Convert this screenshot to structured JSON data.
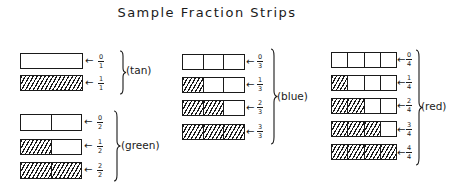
{
  "title": "Sample Fraction Strips",
  "groups": [
    {
      "color_label": "(tan)",
      "denominator": 1,
      "strips": [
        {
          "fraction": {
            "num": "0",
            "den": "1"
          },
          "shaded": 0,
          "parts": 1
        },
        {
          "fraction": {
            "num": "1",
            "den": "1"
          },
          "shaded": 1,
          "parts": 1
        }
      ]
    },
    {
      "color_label": "(green)",
      "denominator": 2,
      "strips": [
        {
          "fraction": {
            "num": "0",
            "den": "2"
          },
          "shaded": 0,
          "parts": 2
        },
        {
          "fraction": {
            "num": "1",
            "den": "2"
          },
          "shaded": 1,
          "parts": 2
        },
        {
          "fraction": {
            "num": "2",
            "den": "2"
          },
          "shaded": 2,
          "parts": 2
        }
      ]
    },
    {
      "color_label": "(blue)",
      "denominator": 3,
      "strips": [
        {
          "fraction": {
            "num": "0",
            "den": "3"
          },
          "shaded": 0,
          "parts": 3
        },
        {
          "fraction": {
            "num": "1",
            "den": "3"
          },
          "shaded": 1,
          "parts": 3
        },
        {
          "fraction": {
            "num": "2",
            "den": "3"
          },
          "shaded": 2,
          "parts": 3
        },
        {
          "fraction": {
            "num": "3",
            "den": "3"
          },
          "shaded": 3,
          "parts": 3
        }
      ]
    },
    {
      "color_label": "(red)",
      "denominator": 4,
      "strips": [
        {
          "fraction": {
            "num": "0",
            "den": "4"
          },
          "shaded": 0,
          "parts": 4
        },
        {
          "fraction": {
            "num": "1",
            "den": "4"
          },
          "shaded": 1,
          "parts": 4
        },
        {
          "fraction": {
            "num": "2",
            "den": "4"
          },
          "shaded": 2,
          "parts": 4
        },
        {
          "fraction": {
            "num": "3",
            "den": "4"
          },
          "shaded": 3,
          "parts": 4
        },
        {
          "fraction": {
            "num": "4",
            "den": "4"
          },
          "shaded": 4,
          "parts": 4
        }
      ]
    }
  ],
  "arrow_glyph": "←"
}
